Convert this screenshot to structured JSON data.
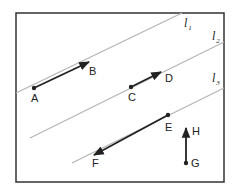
{
  "diagram": {
    "frame": {
      "x": 16,
      "y": 13,
      "width": 208,
      "height": 169,
      "stroke": "#333333"
    },
    "lines": [
      {
        "id": "l1",
        "name": "l",
        "subscript": "1",
        "x1": 16,
        "y1": 93,
        "x2": 182,
        "y2": 13,
        "label_x": 184,
        "label_y": 27,
        "color": "#b5b5b5"
      },
      {
        "id": "l2",
        "name": "l",
        "subscript": "2",
        "x1": 30,
        "y1": 138,
        "x2": 224,
        "y2": 42,
        "label_x": 212,
        "label_y": 40,
        "color": "#b5b5b5"
      },
      {
        "id": "l3",
        "name": "l",
        "subscript": "3",
        "x1": 72,
        "y1": 163,
        "x2": 224,
        "y2": 88,
        "label_x": 212,
        "label_y": 82,
        "color": "#b5b5b5"
      }
    ],
    "vectors": [
      {
        "id": "AB",
        "from": "A",
        "to": "B",
        "x1": 34,
        "y1": 88,
        "x2": 89,
        "y2": 62
      },
      {
        "id": "CD",
        "from": "C",
        "to": "D",
        "x1": 131,
        "y1": 87,
        "x2": 161,
        "y2": 72
      },
      {
        "id": "EF",
        "from": "E",
        "to": "F",
        "x1": 168,
        "y1": 115,
        "x2": 94,
        "y2": 155
      },
      {
        "id": "GH",
        "from": "G",
        "to": "H",
        "x1": 186,
        "y1": 163,
        "x2": 186,
        "y2": 128
      }
    ],
    "points": [
      {
        "label": "A",
        "x": 34,
        "y": 88,
        "label_x": 31,
        "label_y": 102,
        "dot": true
      },
      {
        "label": "B",
        "x": 89,
        "y": 62,
        "label_x": 89,
        "label_y": 75,
        "dot": false
      },
      {
        "label": "C",
        "x": 131,
        "y": 87,
        "label_x": 128,
        "label_y": 101,
        "dot": true
      },
      {
        "label": "D",
        "x": 161,
        "y": 72,
        "label_x": 165,
        "label_y": 82,
        "dot": false
      },
      {
        "label": "E",
        "x": 168,
        "y": 115,
        "label_x": 165,
        "label_y": 131,
        "dot": true
      },
      {
        "label": "F",
        "x": 94,
        "y": 155,
        "label_x": 92,
        "label_y": 167,
        "dot": false
      },
      {
        "label": "G",
        "x": 186,
        "y": 163,
        "label_x": 191,
        "label_y": 167,
        "dot": true
      },
      {
        "label": "H",
        "x": 186,
        "y": 128,
        "label_x": 192,
        "label_y": 135,
        "dot": false
      }
    ],
    "colors": {
      "vector": "#222222",
      "line": "#b5b5b5",
      "frame": "#333333"
    }
  }
}
